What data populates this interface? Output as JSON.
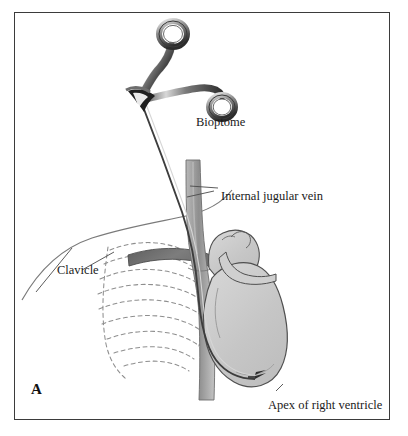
{
  "figure": {
    "panel_letter": "A",
    "background_color": "#ffffff",
    "border_color": "#3b3b3b"
  },
  "labels": [
    {
      "id": "bioptome",
      "text": "Bioptome",
      "x": 196,
      "y": 116
    },
    {
      "id": "jugular",
      "text": "Internal jugular vein",
      "x": 221,
      "y": 190
    },
    {
      "id": "clavicle",
      "text": "Clavicle",
      "x": 57,
      "y": 264
    },
    {
      "id": "apex",
      "text": "Apex of right ventricle",
      "x": 268,
      "y": 399
    }
  ],
  "anatomy": {
    "instrument_name": "bioptome-forceps",
    "vessel_name": "internal-jugular-vein",
    "bone_name": "clavicle",
    "organ_name": "heart",
    "ribcage_name": "rib-cage-dashed",
    "catheter_name": "bioptome-catheter",
    "colors": {
      "instrument_dark": "#2b2b2b",
      "instrument_light": "#d8d8d8",
      "vessel_gray": "#9a9a9a",
      "clavicle_gray": "#6f6f6f",
      "heart_fill": "#c9c9c9",
      "heart_light": "#d9d9d9",
      "outline": "#4a4a4a",
      "rib_dash": "#8c8c8c",
      "body_outline": "#6a6a6a"
    }
  }
}
